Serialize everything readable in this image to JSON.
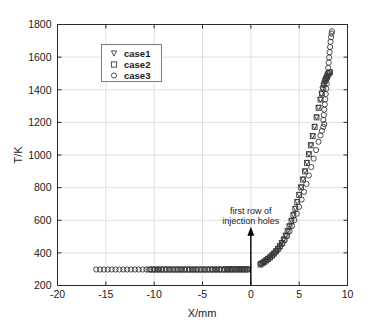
{
  "chart_data": {
    "type": "scatter",
    "title": "",
    "xlabel": "X/mm",
    "ylabel": "T/K",
    "xlim": [
      -20,
      10
    ],
    "ylim": [
      200,
      1800
    ],
    "xticks": [
      -20,
      -15,
      -10,
      -5,
      0,
      5,
      10
    ],
    "yticks": [
      200,
      400,
      600,
      800,
      1000,
      1200,
      1400,
      1600,
      1800
    ],
    "xtick_labels": [
      "-20",
      "-15",
      "-10",
      "-5",
      "0",
      "5",
      "10"
    ],
    "ytick_labels": [
      "200",
      "400",
      "600",
      "800",
      "1000",
      "1200",
      "1400",
      "1600",
      "1800"
    ],
    "grid": true,
    "legend_position": "upper left",
    "legend_entries": [
      {
        "name": "case1",
        "marker": "triangle-down",
        "color": "#3a3a3a"
      },
      {
        "name": "case2",
        "marker": "square",
        "color": "#3a3a3a"
      },
      {
        "name": "case3",
        "marker": "circle",
        "color": "#3a3a3a"
      }
    ],
    "annotations": [
      {
        "text_line1": "first row of",
        "text_line2": "injection holes",
        "arrow_x": 0,
        "arrow_y_from": 200,
        "arrow_y_to": 560
      }
    ],
    "series": [
      {
        "name": "case1",
        "marker": "triangle-down",
        "points": [
          [
            -2.6,
            298
          ],
          [
            -2.4,
            298
          ],
          [
            -2.2,
            298
          ],
          [
            -2.0,
            298
          ],
          [
            -1.8,
            298
          ],
          [
            -1.6,
            298
          ],
          [
            -1.4,
            298
          ],
          [
            -1.2,
            298
          ],
          [
            -1.0,
            298
          ],
          [
            -0.8,
            298
          ],
          [
            -0.6,
            298
          ],
          [
            -0.4,
            298
          ],
          [
            -0.2,
            298
          ],
          [
            1.0,
            330
          ],
          [
            1.2,
            338
          ],
          [
            1.4,
            346
          ],
          [
            1.6,
            355
          ],
          [
            1.8,
            364
          ],
          [
            2.0,
            374
          ],
          [
            2.2,
            385
          ],
          [
            2.4,
            397
          ],
          [
            2.6,
            410
          ],
          [
            2.8,
            425
          ],
          [
            3.0,
            442
          ],
          [
            3.2,
            461
          ],
          [
            3.4,
            482
          ],
          [
            3.6,
            506
          ],
          [
            3.8,
            533
          ],
          [
            4.0,
            563
          ],
          [
            4.2,
            596
          ],
          [
            4.4,
            632
          ],
          [
            4.6,
            671
          ],
          [
            4.8,
            712
          ],
          [
            5.0,
            756
          ],
          [
            5.2,
            802
          ],
          [
            5.4,
            850
          ],
          [
            5.6,
            900
          ],
          [
            5.8,
            952
          ],
          [
            6.0,
            1005
          ],
          [
            6.2,
            1060
          ],
          [
            6.4,
            1116
          ],
          [
            6.6,
            1173
          ],
          [
            6.8,
            1231
          ],
          [
            7.0,
            1290
          ],
          [
            7.2,
            1338
          ],
          [
            7.3,
            1372
          ],
          [
            7.4,
            1402
          ],
          [
            7.5,
            1426
          ],
          [
            7.6,
            1444
          ],
          [
            7.7,
            1458
          ],
          [
            7.8,
            1468
          ],
          [
            7.9,
            1476
          ],
          [
            8.0,
            1482
          ]
        ]
      },
      {
        "name": "case2",
        "marker": "square",
        "points": [
          [
            -10.5,
            298
          ],
          [
            -10.2,
            298
          ],
          [
            -9.9,
            298
          ],
          [
            -9.6,
            298
          ],
          [
            -9.3,
            298
          ],
          [
            -9.0,
            298
          ],
          [
            -8.7,
            298
          ],
          [
            -8.4,
            298
          ],
          [
            -8.1,
            298
          ],
          [
            -7.8,
            298
          ],
          [
            -7.5,
            298
          ],
          [
            -7.2,
            298
          ],
          [
            -6.9,
            298
          ],
          [
            -6.6,
            298
          ],
          [
            -6.3,
            298
          ],
          [
            -6.0,
            298
          ],
          [
            -5.7,
            298
          ],
          [
            -5.4,
            298
          ],
          [
            -5.1,
            298
          ],
          [
            -4.8,
            298
          ],
          [
            -4.5,
            298
          ],
          [
            -4.2,
            298
          ],
          [
            -3.9,
            298
          ],
          [
            -3.6,
            298
          ],
          [
            -3.3,
            298
          ],
          [
            -3.0,
            298
          ],
          [
            -2.7,
            298
          ],
          [
            -2.4,
            298
          ],
          [
            -2.1,
            298
          ],
          [
            -1.8,
            298
          ],
          [
            -1.5,
            298
          ],
          [
            -1.2,
            298
          ],
          [
            -0.9,
            298
          ],
          [
            -0.6,
            298
          ],
          [
            -0.3,
            298
          ],
          [
            1.0,
            328
          ],
          [
            1.2,
            336
          ],
          [
            1.4,
            344
          ],
          [
            1.6,
            353
          ],
          [
            1.8,
            362
          ],
          [
            2.0,
            372
          ],
          [
            2.2,
            383
          ],
          [
            2.4,
            395
          ],
          [
            2.6,
            409
          ],
          [
            2.8,
            424
          ],
          [
            3.0,
            441
          ],
          [
            3.2,
            460
          ],
          [
            3.4,
            481
          ],
          [
            3.6,
            505
          ],
          [
            3.8,
            532
          ],
          [
            4.0,
            562
          ],
          [
            4.2,
            594
          ],
          [
            4.4,
            630
          ],
          [
            4.6,
            669
          ],
          [
            4.8,
            711
          ],
          [
            5.0,
            755
          ],
          [
            5.2,
            801
          ],
          [
            5.4,
            849
          ],
          [
            5.6,
            899
          ],
          [
            5.8,
            951
          ],
          [
            6.0,
            1004
          ],
          [
            6.2,
            1059
          ],
          [
            6.4,
            1115
          ],
          [
            6.6,
            1172
          ],
          [
            6.8,
            1230
          ],
          [
            7.0,
            1289
          ],
          [
            7.2,
            1340
          ],
          [
            7.35,
            1378
          ],
          [
            7.5,
            1412
          ],
          [
            7.6,
            1436
          ],
          [
            7.7,
            1455
          ],
          [
            7.8,
            1470
          ],
          [
            7.9,
            1483
          ],
          [
            8.0,
            1494
          ],
          [
            8.1,
            1502
          ],
          [
            8.2,
            1508
          ]
        ]
      },
      {
        "name": "case3",
        "marker": "circle",
        "points": [
          [
            -16.0,
            298
          ],
          [
            -15.6,
            298
          ],
          [
            -15.2,
            298
          ],
          [
            -14.8,
            298
          ],
          [
            -14.4,
            298
          ],
          [
            -14.0,
            298
          ],
          [
            -13.6,
            298
          ],
          [
            -13.2,
            298
          ],
          [
            -12.8,
            298
          ],
          [
            -12.4,
            298
          ],
          [
            -12.0,
            298
          ],
          [
            -11.6,
            298
          ],
          [
            -11.2,
            298
          ],
          [
            -10.8,
            298
          ],
          [
            -10.4,
            298
          ],
          [
            -10.0,
            298
          ],
          [
            -9.6,
            298
          ],
          [
            -9.2,
            298
          ],
          [
            -8.8,
            298
          ],
          [
            -8.4,
            298
          ],
          [
            -8.0,
            298
          ],
          [
            -7.6,
            298
          ],
          [
            -7.2,
            298
          ],
          [
            -6.8,
            298
          ],
          [
            -6.4,
            298
          ],
          [
            -6.0,
            298
          ],
          [
            -5.6,
            298
          ],
          [
            -5.2,
            298
          ],
          [
            -4.8,
            298
          ],
          [
            -4.4,
            298
          ],
          [
            -4.0,
            298
          ],
          [
            -3.6,
            298
          ],
          [
            -3.2,
            298
          ],
          [
            -2.8,
            298
          ],
          [
            -2.4,
            298
          ],
          [
            -2.0,
            298
          ],
          [
            -1.6,
            298
          ],
          [
            -1.2,
            298
          ],
          [
            -0.8,
            298
          ],
          [
            -0.4,
            298
          ],
          [
            1.0,
            332
          ],
          [
            1.25,
            341
          ],
          [
            1.5,
            351
          ],
          [
            1.75,
            361
          ],
          [
            2.0,
            373
          ],
          [
            2.25,
            386
          ],
          [
            2.5,
            400
          ],
          [
            2.75,
            416
          ],
          [
            3.0,
            434
          ],
          [
            3.25,
            454
          ],
          [
            3.5,
            477
          ],
          [
            3.75,
            503
          ],
          [
            4.0,
            532
          ],
          [
            4.25,
            565
          ],
          [
            4.5,
            601
          ],
          [
            4.75,
            640
          ],
          [
            5.0,
            682
          ],
          [
            5.25,
            727
          ],
          [
            5.5,
            774
          ],
          [
            5.75,
            823
          ],
          [
            6.0,
            874
          ],
          [
            6.25,
            926
          ],
          [
            6.5,
            978
          ],
          [
            6.75,
            1030
          ],
          [
            7.0,
            1081
          ],
          [
            7.2,
            1120
          ],
          [
            7.35,
            1148
          ],
          [
            7.5,
            1172
          ],
          [
            7.6,
            1190
          ],
          [
            7.5,
            1215
          ],
          [
            7.55,
            1245
          ],
          [
            7.6,
            1278
          ],
          [
            7.65,
            1310
          ],
          [
            7.7,
            1342
          ],
          [
            7.75,
            1374
          ],
          [
            7.8,
            1406
          ],
          [
            7.85,
            1438
          ],
          [
            7.9,
            1470
          ],
          [
            7.95,
            1502
          ],
          [
            8.0,
            1534
          ],
          [
            8.05,
            1566
          ],
          [
            8.1,
            1598
          ],
          [
            8.15,
            1630
          ],
          [
            8.2,
            1662
          ],
          [
            8.25,
            1694
          ],
          [
            8.3,
            1722
          ],
          [
            8.35,
            1744
          ],
          [
            8.4,
            1758
          ]
        ]
      }
    ]
  },
  "axes": {
    "x_axis_title": "X/mm",
    "y_axis_title": "T/K"
  }
}
